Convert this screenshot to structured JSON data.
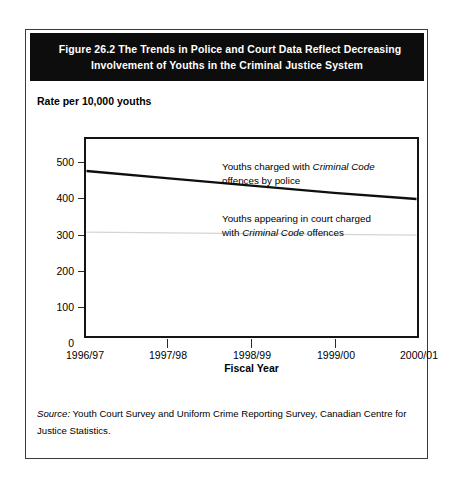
{
  "figure": {
    "header_line_1": "Figure 26.2  The Trends in Police and Court Data Reflect Decreasing",
    "header_line_2": "Involvement of Youths in the Criminal Justice System",
    "axis_note": "Rate per 10,000 youths",
    "source_label": "Source:",
    "source_text": " Youth Court Survey and Uniform Crime Reporting Survey, Canadian Centre for Justice Statistics.",
    "colors": {
      "header_band": "#0d0d0d",
      "header_text": "#ffffff",
      "frame": "#141414",
      "police_line": "#0f0f0f",
      "court_line": "#d5d5d5",
      "card_border": "#3a3a3a"
    }
  },
  "chart_data": {
    "type": "line",
    "title": "Figure 26.2  The Trends in Police and Court Data Reflect Decreasing Involvement of Youths in the Criminal Justice System",
    "xlabel": "Fiscal Year",
    "ylabel": "Rate per 10,000 youths",
    "categories": [
      "1996/97",
      "1997/98",
      "1998/99",
      "1999/00",
      "2000/01"
    ],
    "ylim": [
      0,
      550
    ],
    "yticks": [
      0,
      100,
      200,
      300,
      400,
      500
    ],
    "ytick_labels": [
      "0",
      "100",
      "200",
      "300",
      "400",
      "500"
    ],
    "grid": false,
    "legend": "annotations-inline",
    "series": [
      {
        "name": "Youths charged with Criminal Code offences by police",
        "values": [
          455,
          435,
          415,
          395,
          378
        ],
        "color": "#0f0f0f",
        "width": 2.4,
        "annotation_line_1_a": "Youths charged with ",
        "annotation_line_1_italic": "Criminal Code",
        "annotation_line_2": "offences by police"
      },
      {
        "name": "Youths appearing in court charged with Criminal Code offences",
        "values": [
          287,
          285,
          283,
          281,
          279
        ],
        "color": "#d5d5d5",
        "width": 1.3,
        "annotation_line_1": "Youths appearing in court charged",
        "annotation_line_2_a": "with ",
        "annotation_line_2_italic": "Criminal Code",
        "annotation_line_2_b": " offences"
      }
    ]
  }
}
